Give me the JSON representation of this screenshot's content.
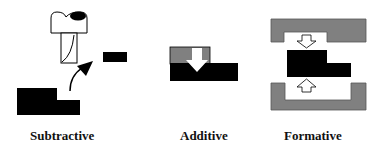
{
  "labels": {
    "subtractive": "Subtractive",
    "additive": "Additive",
    "formative": "Formative"
  },
  "colors": {
    "solid": "#000000",
    "tool_gray": "#808080",
    "outline": "#000000",
    "background": "#ffffff"
  },
  "icons": {
    "subtractive": [
      "milling-cutter-icon",
      "chip-icon",
      "curved-arrow-icon",
      "stepped-workpiece-icon"
    ],
    "additive": [
      "added-material-layer-icon",
      "down-arrow-icon",
      "base-block-icon"
    ],
    "formative": [
      "upper-die-icon",
      "down-arrow-icon",
      "formed-part-icon",
      "up-arrow-icon",
      "lower-die-icon"
    ]
  }
}
